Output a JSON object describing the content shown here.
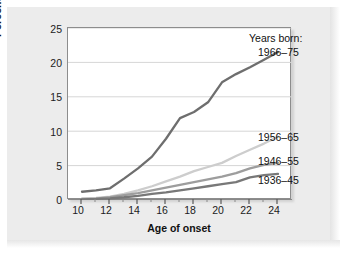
{
  "chart_data": {
    "type": "line",
    "title": "",
    "xlabel": "Age of onset",
    "ylabel": "Percent of population",
    "xlim": [
      9,
      25
    ],
    "ylim": [
      0,
      25
    ],
    "grid": true,
    "legend_position": "right-of-lines",
    "legend_title": "Years born:",
    "xticks": [
      10,
      12,
      14,
      16,
      18,
      20,
      22,
      24
    ],
    "xticks_minor": [
      11,
      13,
      15,
      17,
      19,
      21,
      23
    ],
    "yticks": [
      0,
      5,
      10,
      15,
      20,
      25
    ],
    "x": [
      10,
      11,
      12,
      13,
      14,
      15,
      16,
      17,
      18,
      19,
      20,
      21,
      22,
      23,
      24
    ],
    "series": [
      {
        "name": "1966-75",
        "label": "1966–75",
        "color": "#6e6e6e",
        "width": 2.3,
        "values": [
          1.2,
          1.4,
          1.7,
          3.1,
          4.6,
          6.3,
          8.9,
          11.9,
          12.8,
          14.2,
          17.1,
          18.3,
          19.3,
          20.4,
          21.5
        ]
      },
      {
        "name": "1956-65",
        "label": "1956–65",
        "color": "#cdcdcd",
        "width": 2.3,
        "values": [
          0.2,
          0.3,
          0.5,
          0.9,
          1.4,
          2.0,
          2.7,
          3.4,
          4.2,
          4.8,
          5.4,
          6.4,
          7.3,
          8.2,
          9.2
        ]
      },
      {
        "name": "1946-55",
        "label": "1946–55",
        "color": "#9d9d9d",
        "width": 2.3,
        "values": [
          0.15,
          0.2,
          0.4,
          0.7,
          1.0,
          1.4,
          1.8,
          2.2,
          2.6,
          3.0,
          3.4,
          3.9,
          4.6,
          5.1,
          5.4
        ]
      },
      {
        "name": "1936-45",
        "label": "1936–45",
        "color": "#787878",
        "width": 2.3,
        "values": [
          0.1,
          0.15,
          0.25,
          0.4,
          0.6,
          0.9,
          1.1,
          1.4,
          1.7,
          2.0,
          2.3,
          2.6,
          3.3,
          3.6,
          3.8
        ]
      }
    ]
  },
  "axes": {
    "y_tick_labels": [
      "25",
      "20",
      "15",
      "10",
      "5",
      "0"
    ],
    "x_tick_labels": [
      "10",
      "12",
      "14",
      "16",
      "18",
      "20",
      "22",
      "24"
    ],
    "y_title": "Percent of population",
    "x_title": "Age of onset"
  },
  "legend": {
    "title": "Years born:",
    "items": [
      "1966–75",
      "1956–65",
      "1946–55",
      "1936–45"
    ]
  }
}
